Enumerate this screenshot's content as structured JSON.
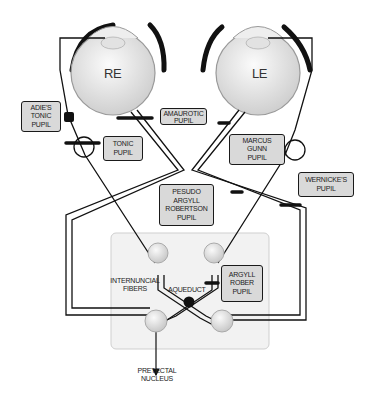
{
  "diagram": {
    "type": "pupillary light reflex pathway with pupil abnormality lesion sites",
    "eyes": {
      "right": "RE",
      "left": "LE"
    },
    "labels": {
      "adies": [
        "ADIE'S",
        "TONIC",
        "PUPIL"
      ],
      "amaurotic": [
        "AMAUROTIC",
        "PUPIL"
      ],
      "tonic": [
        "TONIC",
        "PUPIL"
      ],
      "marcus_gunn": [
        "MARCUS",
        "GUNN",
        "PUPIL"
      ],
      "pseudo_argyll": [
        "PESUDO",
        "ARGYLL",
        "ROBERTSON",
        "PUPIL"
      ],
      "wernicke": [
        "WERNICKE'S",
        "PUPIL"
      ],
      "argyll": [
        "ARGYLL",
        "ROBER",
        "PUPIL"
      ],
      "internuncial": [
        "INTERNUNCIAL",
        "FIBERS"
      ],
      "aqueduct": "AQUEDUCT",
      "pretectal": [
        "PRETECTAL",
        "NUCLEUS"
      ]
    },
    "colors": {
      "line": "#111111",
      "box_fill": "#d9d9d9",
      "midbrain_fill": "#f2f2f2",
      "eye_fill": "#e6e6e6"
    }
  }
}
